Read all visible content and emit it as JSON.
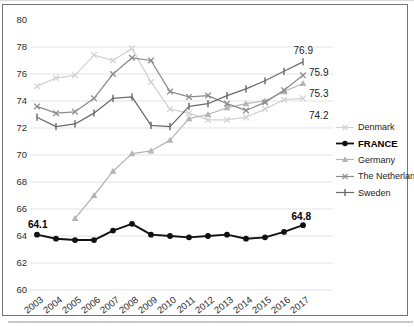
{
  "chart_data": {
    "type": "line",
    "title": "",
    "xlabel": "",
    "ylabel": "",
    "x": [
      2003,
      2004,
      2005,
      2006,
      2007,
      2008,
      2009,
      2010,
      2011,
      2012,
      2013,
      2014,
      2015,
      2016,
      2017
    ],
    "ylim": [
      60,
      80
    ],
    "ytick_step": 2,
    "grid": "horizontal",
    "legend_position": "right-middle",
    "series": [
      {
        "name": "Denmark",
        "color": "#d2d2d2",
        "marker": "x",
        "bold": false,
        "values": [
          75.1,
          75.7,
          75.9,
          77.4,
          77.0,
          77.9,
          75.4,
          73.4,
          73.1,
          72.6,
          72.6,
          72.8,
          73.4,
          74.1,
          74.2
        ]
      },
      {
        "name": "FRANCE",
        "color": "#111111",
        "marker": "circle",
        "bold": true,
        "values": [
          64.1,
          63.8,
          63.7,
          63.7,
          64.4,
          64.9,
          64.1,
          64.0,
          63.9,
          64.0,
          64.1,
          63.8,
          63.9,
          64.3,
          64.8
        ]
      },
      {
        "name": "Germany",
        "color": "#b4b4b4",
        "marker": "triangle",
        "bold": false,
        "values": [
          null,
          null,
          65.3,
          67.0,
          68.8,
          70.1,
          70.3,
          71.1,
          72.7,
          73.0,
          73.5,
          73.8,
          74.0,
          74.7,
          75.3
        ]
      },
      {
        "name": "The Netherlands",
        "color": "#8c8c8c",
        "marker": "x",
        "bold": false,
        "values": [
          73.6,
          73.1,
          73.2,
          74.2,
          76.0,
          77.2,
          77.0,
          74.7,
          74.3,
          74.4,
          73.8,
          73.3,
          73.9,
          74.8,
          75.9
        ]
      },
      {
        "name": "Sweden",
        "color": "#696969",
        "marker": "tick",
        "bold": false,
        "values": [
          72.8,
          72.1,
          72.3,
          73.1,
          74.2,
          74.3,
          72.2,
          72.1,
          73.6,
          73.8,
          74.4,
          74.9,
          75.5,
          76.2,
          76.9
        ]
      }
    ],
    "annotations": [
      {
        "text": "64.1",
        "x": 28,
        "y": 228,
        "bold": true,
        "anchor": "start"
      },
      {
        "text": "64.8",
        "x": 311,
        "y": 220,
        "bold": true,
        "anchor": "end"
      },
      {
        "text": "76.9",
        "x": 313,
        "y": 54,
        "bold": false,
        "anchor": "end"
      },
      {
        "text": "75.9",
        "x": 309,
        "y": 76,
        "bold": false,
        "anchor": "start"
      },
      {
        "text": "75.3",
        "x": 309,
        "y": 97,
        "bold": false,
        "anchor": "start"
      },
      {
        "text": "74.2",
        "x": 309,
        "y": 119,
        "bold": false,
        "anchor": "start"
      }
    ]
  }
}
